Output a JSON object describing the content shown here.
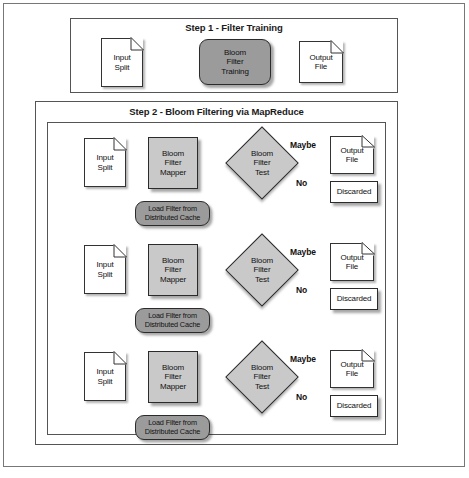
{
  "figure": {
    "type": "flowchart",
    "steps": [
      {
        "id": "step1",
        "title": "Step 1 - Filter Training",
        "nodes": [
          {
            "name": "input-split",
            "shape": "document",
            "label": "Input\nSplit"
          },
          {
            "name": "bloom-filter-training",
            "shape": "rounded-rect",
            "label": "Bloom\nFilter\nTraining"
          },
          {
            "name": "output-file",
            "shape": "document",
            "label": "Output\nFile"
          }
        ],
        "edges": [
          {
            "from": "input-split",
            "to": "bloom-filter-training",
            "label": ""
          },
          {
            "from": "bloom-filter-training",
            "to": "output-file",
            "label": ""
          }
        ]
      },
      {
        "id": "step2",
        "title": "Step 2 - Bloom Filtering via MapReduce",
        "rows": 3,
        "nodes": [
          {
            "name": "input-split",
            "shape": "document",
            "label": "Input\nSplit"
          },
          {
            "name": "bloom-filter-mapper",
            "shape": "rect",
            "label": "Bloom\nFilter\nMapper"
          },
          {
            "name": "load-filter-from-distributed-cache",
            "shape": "rounded-rect",
            "label": "Load Filter from\nDistributed Cache"
          },
          {
            "name": "bloom-filter-test",
            "shape": "diamond",
            "label": "Bloom\nFilter\nTest"
          },
          {
            "name": "output-file",
            "shape": "document",
            "label": "Output\nFile"
          },
          {
            "name": "discarded",
            "shape": "rect",
            "label": "Discarded"
          }
        ],
        "edges": [
          {
            "from": "input-split",
            "to": "bloom-filter-mapper",
            "label": ""
          },
          {
            "from": "bloom-filter-mapper",
            "to": "load-filter-from-distributed-cache",
            "label": ""
          },
          {
            "from": "load-filter-from-distributed-cache",
            "to": "bloom-filter-test",
            "label": ""
          },
          {
            "from": "bloom-filter-test",
            "to": "output-file",
            "label": "Maybe"
          },
          {
            "from": "bloom-filter-test",
            "to": "discarded",
            "label": "No"
          }
        ]
      }
    ],
    "labels": {
      "input_split": "Input Split",
      "input_split_l1": "Input",
      "input_split_l2": "Split",
      "bloom_filter_training_l1": "Bloom",
      "bloom_filter_training_l2": "Filter",
      "bloom_filter_training_l3": "Training",
      "bloom_filter_mapper_l1": "Bloom",
      "bloom_filter_mapper_l2": "Filter",
      "bloom_filter_mapper_l3": "Mapper",
      "bloom_filter_test_l1": "Bloom",
      "bloom_filter_test_l2": "Filter",
      "bloom_filter_test_l3": "Test",
      "load_filter_l1": "Load Filter from",
      "load_filter_l2": "Distributed Cache",
      "output_file_l1": "Output",
      "output_file_l2": "File",
      "discarded": "Discarded",
      "maybe": "Maybe",
      "no": "No"
    },
    "colors": {
      "process_fill": "#c9c9c9",
      "capsule_fill": "#9b9b9b",
      "doc_fill": "#ffffff",
      "stroke": "#2b2b2b",
      "frame": "#777777",
      "text": "#111111"
    }
  }
}
